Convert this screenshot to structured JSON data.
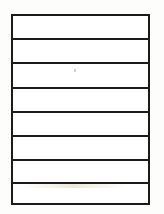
{
  "document": {
    "title": "Blank lined table",
    "kind": "empty-ruled-table",
    "background_color": "#fdfdfc",
    "paper_color": "#ffffff",
    "line_color": "#1b1b1b",
    "border_width_px": 2,
    "frame": {
      "left_px": 11,
      "top_px": 14,
      "width_px": 139,
      "height_px": 191
    },
    "row_count": 8,
    "column_count": 1,
    "row_height_px": 24,
    "divider_y_positions": [
      38,
      62,
      87,
      111,
      135,
      159,
      182
    ],
    "rows": [
      {
        "index": 1,
        "text": ""
      },
      {
        "index": 2,
        "text": ""
      },
      {
        "index": 3,
        "text": ""
      },
      {
        "index": 4,
        "text": ""
      },
      {
        "index": 5,
        "text": ""
      },
      {
        "index": 6,
        "text": ""
      },
      {
        "index": 7,
        "text": ""
      },
      {
        "index": 8,
        "text": ""
      }
    ]
  }
}
